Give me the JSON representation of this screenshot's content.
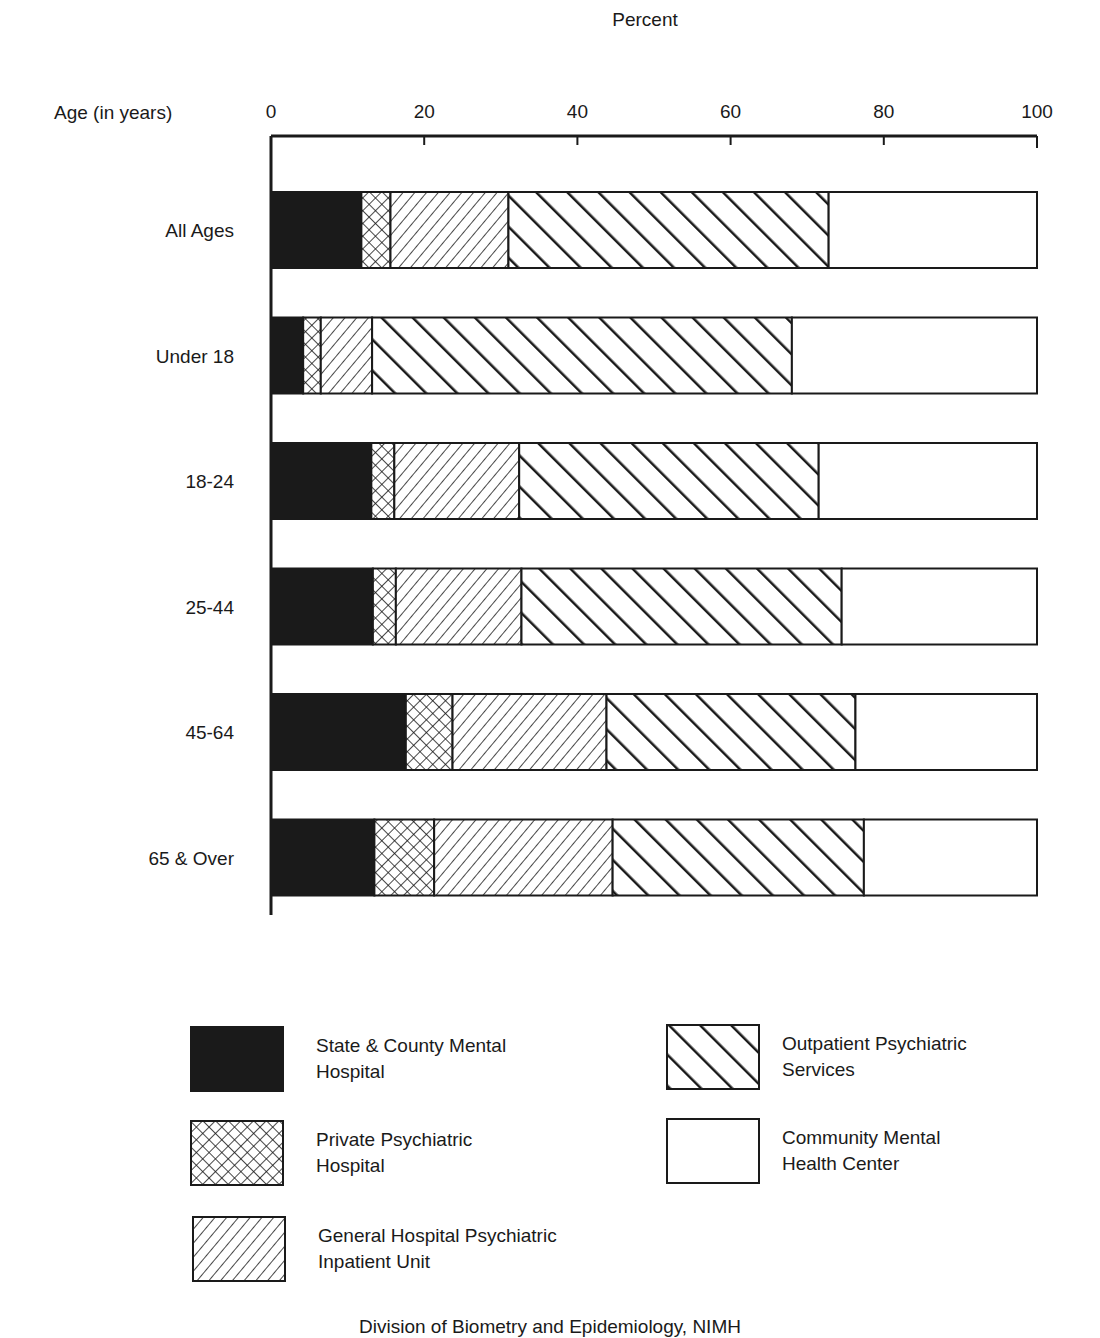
{
  "chart_data": {
    "type": "bar",
    "orientation": "horizontal",
    "stacked": true,
    "title": "",
    "xlabel": "Percent",
    "ylabel": "Age (in years)",
    "xlim": [
      0,
      100
    ],
    "xticks": [
      0,
      20,
      40,
      60,
      80,
      100
    ],
    "grid": false,
    "legend_position": "bottom",
    "categories": [
      "All Ages",
      "Under 18",
      "18-24",
      "25-44",
      "45-64",
      "65 & Over"
    ],
    "series": [
      {
        "name": "State & County Mental Hospital",
        "pattern": "solid-black",
        "values": [
          11.8,
          4.2,
          13.1,
          13.3,
          17.6,
          13.5
        ]
      },
      {
        "name": "Private Psychiatric Hospital",
        "pattern": "crosshatch",
        "values": [
          3.8,
          2.3,
          3.0,
          3.0,
          6.1,
          7.8
        ]
      },
      {
        "name": "General Hospital Psychiatric Inpatient Unit",
        "pattern": "fine-diagonal-forward",
        "values": [
          15.4,
          6.7,
          16.3,
          16.4,
          20.1,
          23.3
        ]
      },
      {
        "name": "Outpatient Psychiatric Services",
        "pattern": "bold-diagonal-backward",
        "values": [
          41.8,
          54.8,
          39.1,
          41.8,
          32.5,
          32.8
        ]
      },
      {
        "name": "Community Mental Health Center",
        "pattern": "white",
        "values": [
          27.2,
          32.0,
          28.5,
          25.5,
          23.7,
          22.6
        ]
      }
    ]
  },
  "legend": {
    "items": [
      {
        "line1": "State & County Mental",
        "line2": "Hospital"
      },
      {
        "line1": "Private Psychiatric",
        "line2": "Hospital"
      },
      {
        "line1": "General Hospital Psychiatric",
        "line2": "Inpatient Unit"
      },
      {
        "line1": "Outpatient Psychiatric",
        "line2": "Services"
      },
      {
        "line1": "Community Mental",
        "line2": "Health Center"
      }
    ]
  },
  "footer": {
    "source": "Division of Biometry and Epidemiology, NIMH"
  },
  "colors": {
    "ink": "#1a1a1a",
    "paper": "#ffffff"
  }
}
